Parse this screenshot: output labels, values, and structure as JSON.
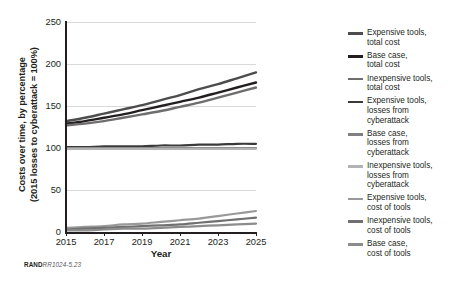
{
  "credit": {
    "org": "RAND",
    "figure_id": "RR1024-5.23"
  },
  "chart_data": {
    "type": "line",
    "title": "",
    "xlabel": "Year",
    "ylabel": "Costs over time, by percentage (2015 losses to cyberattack = 100%)",
    "ylabel_line1": "Costs over time, by percentage",
    "ylabel_line2": "(2015 losses to cyberattack = 100%)",
    "x": [
      2015,
      2016,
      2017,
      2018,
      2019,
      2020,
      2021,
      2022,
      2023,
      2024,
      2025
    ],
    "xticks": [
      2015,
      2017,
      2019,
      2021,
      2023,
      2025
    ],
    "xlim": [
      2015,
      2025
    ],
    "yticks": [
      0,
      50,
      100,
      150,
      200,
      250
    ],
    "ylim": [
      0,
      250
    ],
    "grid": true,
    "legend_position": "right",
    "series": [
      {
        "name": "Expensive tools,\ntotal cost",
        "label_line1": "Expensive tools,",
        "label_line2": "total cost",
        "color": "#4d4d4d",
        "width": 2.4,
        "values": [
          132,
          136,
          141,
          146,
          151,
          157,
          163,
          170,
          176,
          183,
          190
        ]
      },
      {
        "name": "Base case,\ntotal cost",
        "label_line1": "Base case,",
        "label_line2": "total cost",
        "color": "#231f20",
        "width": 2.4,
        "values": [
          129,
          132,
          136,
          140,
          145,
          150,
          155,
          160,
          166,
          172,
          178
        ]
      },
      {
        "name": "Inexpensive tools,\ntotal cost",
        "label_line1": "Inexpensive tools,",
        "label_line2": "total cost",
        "color": "#6e6e6e",
        "width": 2.4,
        "values": [
          127,
          129,
          132,
          136,
          140,
          144,
          149,
          154,
          160,
          166,
          172
        ]
      },
      {
        "name": "Expensive tools,\nlosses from\ncyberattack",
        "label_line1": "Expensive tools,",
        "label_line2": "losses from",
        "label_line3": "cyberattack",
        "color": "#3a3a3a",
        "width": 2.2,
        "values": [
          101,
          101,
          102,
          102,
          102,
          103,
          103,
          104,
          104,
          105,
          105
        ]
      },
      {
        "name": "Base case,\nlosses from\ncyberattack",
        "label_line1": "Base case,",
        "label_line2": "losses from",
        "label_line3": "cyberattack",
        "color": "#808080",
        "width": 2.2,
        "values": [
          100,
          100,
          100,
          100,
          100,
          100,
          100,
          100,
          100,
          100,
          100
        ]
      },
      {
        "name": "Inexpensive tools,\nlosses from\ncyberattack",
        "label_line1": "Inexpensive tools,",
        "label_line2": "losses from",
        "label_line3": "cyberattack",
        "color": "#b3b3b3",
        "width": 2.2,
        "values": [
          99,
          99,
          99,
          99,
          99,
          99,
          99,
          99,
          99,
          99,
          99
        ]
      },
      {
        "name": "Expensive tools,\ncost of tools",
        "label_line1": "Expensive tools,",
        "label_line2": "cost of tools",
        "color": "#999999",
        "width": 2.2,
        "values": [
          5,
          6,
          7,
          9,
          10,
          12,
          14,
          16,
          19,
          22,
          25
        ]
      },
      {
        "name": "Inexpensive tools,\ncost of tools",
        "label_line1": "Inexpensive tools,",
        "label_line2": "cost of tools",
        "color": "#707070",
        "width": 2.2,
        "values": [
          3,
          4,
          5,
          6,
          7,
          8,
          9,
          11,
          13,
          15,
          17
        ]
      },
      {
        "name": "Base case,\ncost of tools",
        "label_line1": "Base case,",
        "label_line2": "cost of tools",
        "color": "#8c8c8c",
        "width": 2.2,
        "values": [
          2,
          2,
          3,
          4,
          4,
          5,
          6,
          7,
          8,
          9,
          10
        ]
      }
    ]
  }
}
